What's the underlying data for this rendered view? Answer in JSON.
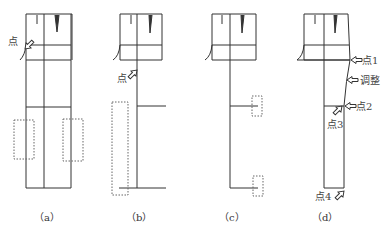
{
  "figure": {
    "panels": [
      {
        "id": "a",
        "caption": "（a）",
        "labels": [
          {
            "text": "点"
          }
        ]
      },
      {
        "id": "b",
        "caption": "（b）",
        "labels": [
          {
            "text": "点"
          }
        ]
      },
      {
        "id": "c",
        "caption": "（c）",
        "labels": []
      },
      {
        "id": "d",
        "caption": "（d）",
        "labels": [
          {
            "text": "点1"
          },
          {
            "text": "调整"
          },
          {
            "text": "点2"
          },
          {
            "text": "点3"
          },
          {
            "text": "点4"
          }
        ]
      }
    ],
    "colors": {
      "line": "#333333",
      "dotted": "#666666",
      "text": "#444444"
    }
  }
}
